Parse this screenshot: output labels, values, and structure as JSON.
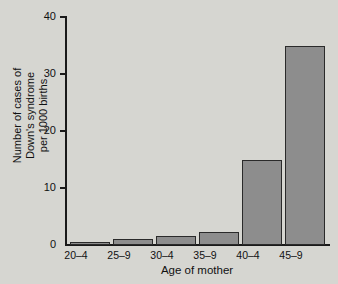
{
  "chart_data": {
    "type": "bar",
    "title": "",
    "subtitle": "",
    "xlabel": "Age of mother",
    "ylabel_lines": [
      "Number of cases of",
      "Down's syndrome",
      "per 1000 births"
    ],
    "ylabel": "Number of cases of Down's syndrome per 1000 births",
    "categories": [
      "20–4",
      "25–9",
      "30–4",
      "35–9",
      "40–4",
      "45–9"
    ],
    "values": [
      0.5,
      1,
      1.5,
      2.3,
      15,
      35
    ],
    "ylim": [
      0,
      40
    ],
    "y_ticks": [
      0,
      10,
      20,
      30,
      40
    ],
    "y_tick_labels": [
      "0",
      "10",
      "20",
      "30",
      "40"
    ],
    "grid": false,
    "legend": false,
    "legend_position": "none",
    "bar_fill_color": "#8d8d8d",
    "bar_edge_color": "#2a2a2a",
    "background_color": "#d6d6d1",
    "axis_color": "#1a1a1a",
    "text_color": "#111111"
  }
}
